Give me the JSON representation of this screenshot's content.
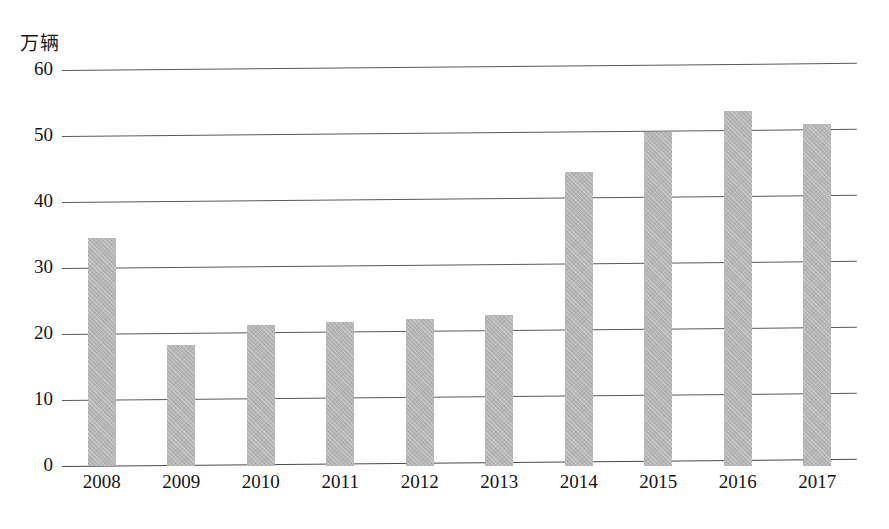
{
  "chart_data": {
    "type": "bar",
    "title": "",
    "subtitle": "",
    "xlabel": "",
    "ylabel": "万辆",
    "unit_label": "万辆",
    "categories": [
      "2008",
      "2009",
      "2010",
      "2011",
      "2012",
      "2013",
      "2014",
      "2015",
      "2016",
      "2017"
    ],
    "values": [
      34.6,
      18.4,
      21.4,
      21.8,
      22.3,
      22.9,
      44.6,
      50.6,
      53.8,
      51.8
    ],
    "series": [
      {
        "name": "",
        "values": [
          34.6,
          18.4,
          21.4,
          21.8,
          22.3,
          22.9,
          44.6,
          50.6,
          53.8,
          51.8
        ]
      }
    ],
    "ylim": [
      0,
      60
    ],
    "yticks": [
      0,
      10,
      20,
      30,
      40,
      50,
      60
    ],
    "ytick_labels": [
      "0",
      "10",
      "20",
      "30",
      "40",
      "50",
      "60"
    ],
    "grid": true,
    "grid_axis": "y",
    "legend": false,
    "legend_position": "none",
    "bar_color": "#b5b5b5",
    "gridline_color": "#5a5a5a",
    "text_color": "#141414",
    "background_color": "#ffffff"
  },
  "axis": {
    "unit_label": "万辆",
    "y_ticks": [
      {
        "label": "60",
        "value": 60
      },
      {
        "label": "50",
        "value": 50
      },
      {
        "label": "40",
        "value": 40
      },
      {
        "label": "30",
        "value": 30
      },
      {
        "label": "20",
        "value": 20
      },
      {
        "label": "10",
        "value": 10
      },
      {
        "label": "0",
        "value": 0
      }
    ],
    "x_ticks": [
      {
        "label": "2008"
      },
      {
        "label": "2009"
      },
      {
        "label": "2010"
      },
      {
        "label": "2011"
      },
      {
        "label": "2012"
      },
      {
        "label": "2013"
      },
      {
        "label": "2014"
      },
      {
        "label": "2015"
      },
      {
        "label": "2016"
      },
      {
        "label": "2017"
      }
    ]
  }
}
